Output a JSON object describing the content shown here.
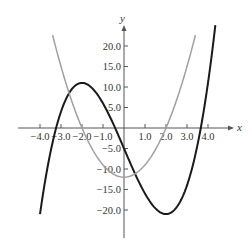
{
  "chart_data": {
    "type": "line",
    "title": "",
    "xlabel": "x",
    "ylabel": "y",
    "xlim": [
      -4.0,
      4.5
    ],
    "ylim": [
      -25.0,
      24.0
    ],
    "grid": false,
    "legend": null,
    "x_ticks": [
      -4.0,
      -3.0,
      -2.0,
      -1.0,
      1.0,
      2.0,
      3.0,
      4.0
    ],
    "x_tick_labels": [
      "−4.0",
      "−3.0",
      "−2.0",
      "−1.0",
      "1.0",
      "2.0",
      "3.0",
      "4.0"
    ],
    "y_ticks": [
      20.0,
      15.0,
      10.0,
      5.0,
      -5.0,
      -10.0,
      -15.0,
      -20.0
    ],
    "y_tick_labels": [
      "20.0",
      "15.0",
      "10.0",
      "5.0",
      "−5.0",
      "−10.0",
      "−15.0",
      "−20.0"
    ],
    "series": [
      {
        "name": "f(x) cubic",
        "color": "#1a1a1a",
        "x": [
          -4.0,
          -3.5,
          -3.0,
          -2.5,
          -2.0,
          -1.5,
          -1.0,
          -0.5,
          0.0,
          0.5,
          1.0,
          1.5,
          2.0,
          2.5,
          3.0,
          3.5,
          4.0,
          4.35
        ],
        "values": [
          -21.0,
          -5.9,
          4.0,
          9.4,
          11.0,
          9.6,
          6.0,
          0.9,
          -5.0,
          -10.9,
          -16.0,
          -19.6,
          -21.0,
          -19.4,
          -14.0,
          -4.1,
          11.0,
          25.1
        ]
      },
      {
        "name": "f'(x) parabola",
        "color": "#a0a0a0",
        "x": [
          -3.4,
          -3.0,
          -2.5,
          -2.0,
          -1.5,
          -1.0,
          -0.5,
          0.0,
          0.5,
          1.0,
          1.5,
          2.0,
          2.5,
          3.0,
          3.4
        ],
        "values": [
          22.7,
          15.0,
          6.75,
          0.0,
          -5.25,
          -9.0,
          -11.25,
          -12.0,
          -11.25,
          -9.0,
          -5.25,
          0.0,
          6.75,
          15.0,
          22.7
        ]
      }
    ]
  },
  "labels": {
    "x_axis": "x",
    "y_axis": "y"
  }
}
